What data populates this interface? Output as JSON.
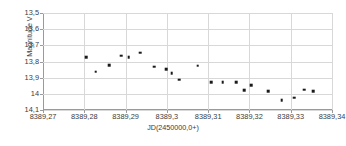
{
  "chart_data": {
    "type": "scatter",
    "title": "",
    "xlabel": "JD(2450000,0+)",
    "ylabel": "Magnitude V",
    "xlim": [
      8389.27,
      8389.34
    ],
    "ylim": [
      13.5,
      14.1
    ],
    "y_inverted": true,
    "grid": true,
    "legend": null,
    "xticks": [
      "8389,27",
      "8389,28",
      "8389,29",
      "8389,3",
      "8389,31",
      "8389,32",
      "8389,33",
      "8389,34"
    ],
    "xtick_values": [
      8389.27,
      8389.28,
      8389.29,
      8389.3,
      8389.31,
      8389.32,
      8389.33,
      8389.34
    ],
    "yticks": [
      "13,5",
      "13,6",
      "13,7",
      "13,8",
      "13,9",
      "14",
      "14,1"
    ],
    "ytick_values": [
      13.5,
      13.6,
      13.7,
      13.8,
      13.9,
      14.0,
      14.1
    ],
    "marker": "square",
    "marker_color": "#1a1a1a",
    "points": [
      {
        "x": 8389.2805,
        "y": 13.773
      },
      {
        "x": 8389.2828,
        "y": 13.863
      },
      {
        "x": 8389.286,
        "y": 13.823
      },
      {
        "x": 8389.289,
        "y": 13.764
      },
      {
        "x": 8389.2908,
        "y": 13.775
      },
      {
        "x": 8389.2935,
        "y": 13.745
      },
      {
        "x": 8389.297,
        "y": 13.833
      },
      {
        "x": 8389.2998,
        "y": 13.846
      },
      {
        "x": 8389.3012,
        "y": 13.871
      },
      {
        "x": 8389.303,
        "y": 13.913
      },
      {
        "x": 8389.3075,
        "y": 13.827
      },
      {
        "x": 8389.3108,
        "y": 13.928
      },
      {
        "x": 8389.3135,
        "y": 13.928
      },
      {
        "x": 8389.3168,
        "y": 13.929
      },
      {
        "x": 8389.3188,
        "y": 13.976
      },
      {
        "x": 8389.3205,
        "y": 13.947
      },
      {
        "x": 8389.3245,
        "y": 13.982
      },
      {
        "x": 8389.3278,
        "y": 14.038
      },
      {
        "x": 8389.3308,
        "y": 14.024
      },
      {
        "x": 8389.3332,
        "y": 13.975
      },
      {
        "x": 8389.3355,
        "y": 13.983
      }
    ]
  },
  "caption": {
    "text": ""
  }
}
